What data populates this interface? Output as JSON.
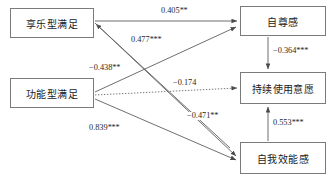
{
  "diagram": {
    "type": "path-diagram",
    "title": "",
    "nodes": [
      {
        "id": "hedonic",
        "label": "享乐型满足",
        "x": 10,
        "y": 8,
        "w": 84,
        "h": 30
      },
      {
        "id": "functional",
        "label": "功能型满足",
        "x": 10,
        "y": 78,
        "w": 84,
        "h": 30
      },
      {
        "id": "esteem",
        "label": "自尊感",
        "x": 240,
        "y": 6,
        "w": 86,
        "h": 30
      },
      {
        "id": "intention",
        "label": "持续使用意愿",
        "x": 240,
        "y": 72,
        "w": 86,
        "h": 32
      },
      {
        "id": "efficacy",
        "label": "自我效能感",
        "x": 240,
        "y": 142,
        "w": 86,
        "h": 32
      }
    ],
    "edges": [
      {
        "id": "e1",
        "from": "hedonic",
        "to": "esteem",
        "coef": "0.405",
        "stars": "**",
        "value": 0.405,
        "style": "solid",
        "label_x": 160,
        "label_y": 7
      },
      {
        "id": "e2",
        "from": "functional",
        "to": "esteem",
        "coef": "0.477",
        "stars": "***",
        "value": 0.477,
        "style": "solid",
        "label_x": 130,
        "label_y": 36
      },
      {
        "id": "e3",
        "from": "functional",
        "to": "hedonic",
        "coef": "−0.438",
        "stars": "**",
        "value": -0.438,
        "style": "solid",
        "label_x": 88,
        "label_y": 64
      },
      {
        "id": "e4",
        "from": "functional",
        "to": "intention",
        "coef": "−0.174",
        "stars": "",
        "value": -0.174,
        "style": "dotted",
        "label_x": 172,
        "label_y": 79
      },
      {
        "id": "e5",
        "from": "hedonic",
        "to": "efficacy",
        "coef": "−0.471",
        "stars": "**",
        "value": -0.471,
        "style": "solid",
        "label_x": 186,
        "label_y": 112
      },
      {
        "id": "e6",
        "from": "functional",
        "to": "efficacy",
        "coef": "0.839",
        "stars": "***",
        "value": 0.839,
        "style": "solid",
        "label_x": 88,
        "label_y": 124
      },
      {
        "id": "e7",
        "from": "esteem",
        "to": "intention",
        "coef": "−0.364",
        "stars": "***",
        "value": -0.364,
        "style": "solid",
        "label_x": 272,
        "label_y": 47
      },
      {
        "id": "e8",
        "from": "efficacy",
        "to": "intention",
        "coef": "0.553",
        "stars": "***",
        "value": 0.553,
        "style": "solid",
        "label_x": 272,
        "label_y": 119
      }
    ],
    "legend": {
      "significance_note": ""
    },
    "colors": {
      "box_border": "#7b7b7b",
      "line": "#5f5f5f",
      "text": "#1a1a1a",
      "background": "#ffffff"
    }
  }
}
